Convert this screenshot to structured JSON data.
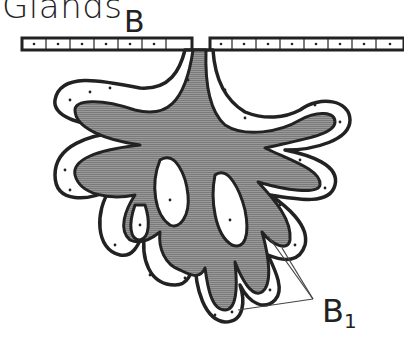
{
  "figure": {
    "title": "Glands",
    "panel_letter": "B",
    "callout_label": "B",
    "callout_subscript": "1",
    "colors": {
      "outline": "#222222",
      "lumen_fill": "#8a8a8a",
      "cell_fill": "#ffffff",
      "leader_line": "#444444"
    }
  }
}
